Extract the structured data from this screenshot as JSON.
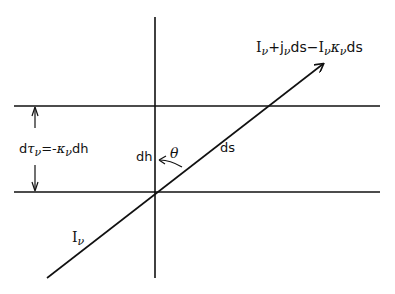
{
  "diagram": {
    "type": "radiative-transfer-geometry",
    "colors": {
      "line": "#111111",
      "background": "#ffffff"
    },
    "elements": {
      "vertical_axis": {
        "x": 155,
        "y1": 17,
        "y2": 278
      },
      "upper_plane": {
        "y": 106,
        "x1": 14,
        "x2": 380
      },
      "lower_plane": {
        "y": 192,
        "x1": 14,
        "x2": 380
      },
      "ray": {
        "x1": 47,
        "y1": 278,
        "x2": 323,
        "y2": 64
      },
      "thickness_arrow": {
        "x": 35,
        "y1": 106,
        "y2": 192
      }
    },
    "labels": {
      "outgoing": {
        "I": "I",
        "nu1": "ν",
        "plus": "+",
        "j": "j",
        "nu2": "ν",
        "ds1": "ds",
        "minus": "−",
        "I2": "I",
        "nu3": "ν",
        "kappa": "κ",
        "nu4": "ν",
        "ds2": "ds"
      },
      "optical_depth": {
        "d": "d",
        "tau": "τ",
        "nu1": "ν",
        "eq": "=-",
        "kappa": "κ",
        "nu2": "ν",
        "dh": "dh"
      },
      "dh": "dh",
      "theta": "θ",
      "ds": "ds",
      "incoming": {
        "I": "I",
        "nu": "ν"
      }
    }
  }
}
